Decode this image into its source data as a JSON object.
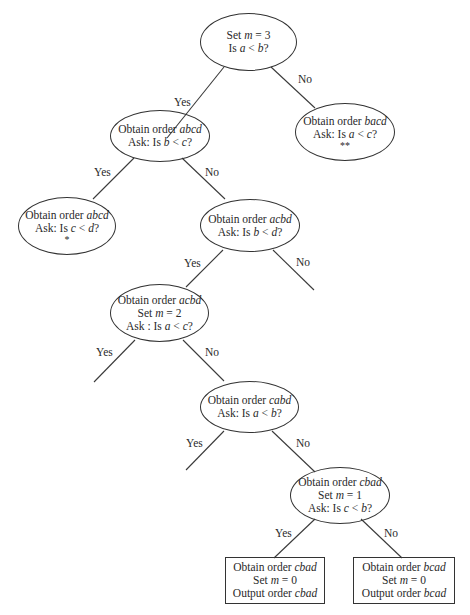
{
  "diagram": {
    "type": "decision-tree",
    "nodes": {
      "root": {
        "lines": [
          "Set m = 3",
          "Is a < b?"
        ]
      },
      "n_abcd_bc": {
        "lines": [
          "Obtain order abcd",
          "Ask: Is b < c?"
        ]
      },
      "n_bacd": {
        "lines": [
          "Obtain order bacd",
          "Ask: Is a < c?"
        ],
        "mark": "**"
      },
      "n_abcd_cd": {
        "lines": [
          "Obtain order abcd",
          "Ask: Is c < d?"
        ],
        "mark": "*"
      },
      "n_acbd_bd": {
        "lines": [
          "Obtain order acbd",
          "Ask: Is b < d?"
        ]
      },
      "n_acbd_m2": {
        "lines": [
          "Obtain order acbd",
          "Set m = 2",
          "Ask : Is a < c?"
        ]
      },
      "n_cabd": {
        "lines": [
          "Obtain order cabd",
          "Ask: Is a < b?"
        ]
      },
      "n_cbad": {
        "lines": [
          "Obtain order cbad",
          "Set m = 1",
          "Ask: Is c < b?"
        ]
      },
      "leaf_cbad": {
        "lines": [
          "Obtain order cbad",
          "Set m = 0",
          "Output order cbad"
        ]
      },
      "leaf_bcad": {
        "lines": [
          "Obtain order bcad",
          "Set m = 0",
          "Output order bcad"
        ]
      }
    },
    "edge_labels": {
      "yes": "Yes",
      "no": "No"
    },
    "edges": [
      {
        "from": "root",
        "to": "n_abcd_bc",
        "label": "Yes"
      },
      {
        "from": "root",
        "to": "n_bacd",
        "label": "No"
      },
      {
        "from": "n_abcd_bc",
        "to": "n_abcd_cd",
        "label": "Yes"
      },
      {
        "from": "n_abcd_bc",
        "to": "n_acbd_bd",
        "label": "No"
      },
      {
        "from": "n_acbd_bd",
        "to": "n_acbd_m2",
        "label": "Yes"
      },
      {
        "from": "n_acbd_bd",
        "to": null,
        "label": "No"
      },
      {
        "from": "n_acbd_m2",
        "to": null,
        "label": "Yes"
      },
      {
        "from": "n_acbd_m2",
        "to": "n_cabd",
        "label": "No"
      },
      {
        "from": "n_cabd",
        "to": null,
        "label": "Yes"
      },
      {
        "from": "n_cabd",
        "to": "n_cbad",
        "label": "No"
      },
      {
        "from": "n_cbad",
        "to": "leaf_cbad",
        "label": "Yes"
      },
      {
        "from": "n_cbad",
        "to": "leaf_bcad",
        "label": "No"
      }
    ]
  }
}
